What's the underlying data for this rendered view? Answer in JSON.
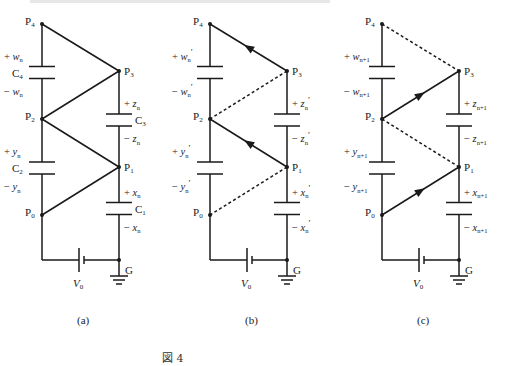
{
  "figure_caption": "図 4",
  "panels": [
    {
      "id": "a",
      "caption": "(a)",
      "nodes": [
        "P4",
        "P3",
        "P2",
        "P1",
        "P0",
        "G"
      ],
      "left_caps": [
        {
          "name": "C4",
          "plus": "+ w",
          "minus": "− w",
          "sub": "n",
          "prime": ""
        },
        {
          "name": "C2",
          "plus": "+ y",
          "minus": "− y",
          "sub": "n",
          "prime": ""
        }
      ],
      "right_caps": [
        {
          "name": "C3",
          "plus": "+ z",
          "minus": "− z",
          "sub": "n",
          "prime": ""
        },
        {
          "name": "C1",
          "plus": "+ x",
          "minus": "− x",
          "sub": "n",
          "prime": ""
        }
      ],
      "links": [
        {
          "from": "P4",
          "to": "P3",
          "style": "solid",
          "arrow": "none"
        },
        {
          "from": "P3",
          "to": "P2",
          "style": "solid",
          "arrow": "none"
        },
        {
          "from": "P2",
          "to": "P1",
          "style": "solid",
          "arrow": "none"
        },
        {
          "from": "P1",
          "to": "P0",
          "style": "solid",
          "arrow": "none"
        }
      ],
      "source_label": "V",
      "source_sub": "0"
    },
    {
      "id": "b",
      "caption": "(b)",
      "nodes": [
        "P4",
        "P3",
        "P2",
        "P1",
        "P0",
        "G"
      ],
      "left_caps": [
        {
          "name": "",
          "plus": "+ w",
          "minus": "− w",
          "sub": "n",
          "prime": "′"
        },
        {
          "name": "",
          "plus": "+ y",
          "minus": "− y",
          "sub": "n",
          "prime": "′"
        }
      ],
      "right_caps": [
        {
          "name": "",
          "plus": "+ z",
          "minus": "− z",
          "sub": "n",
          "prime": "′"
        },
        {
          "name": "",
          "plus": "+ x",
          "minus": "− x",
          "sub": "n",
          "prime": "′"
        }
      ],
      "links": [
        {
          "from": "P4",
          "to": "P3",
          "style": "solid",
          "arrow": "toward-P4"
        },
        {
          "from": "P3",
          "to": "P2",
          "style": "dashed",
          "arrow": "none"
        },
        {
          "from": "P2",
          "to": "P1",
          "style": "solid",
          "arrow": "toward-P2"
        },
        {
          "from": "P1",
          "to": "P0",
          "style": "dashed",
          "arrow": "none"
        }
      ],
      "source_label": "V",
      "source_sub": "0"
    },
    {
      "id": "c",
      "caption": "(c)",
      "nodes": [
        "P4",
        "P3",
        "P2",
        "P1",
        "P0",
        "G"
      ],
      "left_caps": [
        {
          "name": "",
          "plus": "+ w",
          "minus": "− w",
          "sub": "n+1",
          "prime": ""
        },
        {
          "name": "",
          "plus": "+ y",
          "minus": "− y",
          "sub": "n+1",
          "prime": ""
        }
      ],
      "right_caps": [
        {
          "name": "",
          "plus": "+ z",
          "minus": "− z",
          "sub": "n+1",
          "prime": ""
        },
        {
          "name": "",
          "plus": "+ x",
          "minus": "− x",
          "sub": "n+1",
          "prime": ""
        }
      ],
      "links": [
        {
          "from": "P4",
          "to": "P3",
          "style": "dashed",
          "arrow": "none"
        },
        {
          "from": "P3",
          "to": "P2",
          "style": "solid",
          "arrow": "toward-P3"
        },
        {
          "from": "P2",
          "to": "P1",
          "style": "dashed",
          "arrow": "none"
        },
        {
          "from": "P1",
          "to": "P0",
          "style": "solid",
          "arrow": "toward-P1"
        }
      ],
      "source_label": "V",
      "source_sub": "0"
    }
  ],
  "colors": {
    "ink": "#1a1a1a",
    "label": "#333333"
  }
}
